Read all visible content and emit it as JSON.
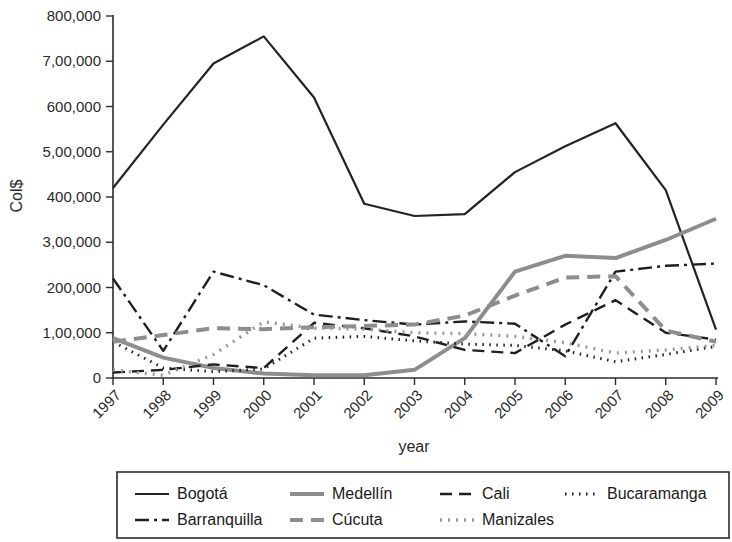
{
  "chart_data": {
    "type": "line",
    "title": "",
    "xlabel": "year",
    "ylabel": "Col$",
    "x": [
      1997,
      1998,
      1999,
      2000,
      2001,
      2002,
      2003,
      2004,
      2005,
      2006,
      2007,
      2008,
      2009
    ],
    "xtick_labels": [
      "1997",
      "1998",
      "1999",
      "2000",
      "2001",
      "2002",
      "2003",
      "2004",
      "2005",
      "2006",
      "2007",
      "2008",
      "2009"
    ],
    "ytick_values": [
      0,
      100000,
      200000,
      300000,
      400000,
      500000,
      600000,
      700000,
      800000
    ],
    "ytick_labels": [
      "0",
      "1,00,000",
      "200,000",
      "3,00,000",
      "400,000",
      "5,00,000",
      "600,000",
      "7,00,000",
      "800,000"
    ],
    "ylim": [
      0,
      800000
    ],
    "xlim": [
      1997,
      2009
    ],
    "grid": false,
    "legend_position": "bottom",
    "series": [
      {
        "name": "Bogotá",
        "style": "solid",
        "color": "#232323",
        "width": 2.2,
        "dash": "none",
        "values": [
          420000,
          560000,
          695000,
          755000,
          620000,
          385000,
          358000,
          362000,
          455000,
          512000,
          563000,
          415000,
          107000
        ]
      },
      {
        "name": "Medellín",
        "style": "solid",
        "color": "#8d8d8d",
        "width": 4.0,
        "dash": "none",
        "values": [
          88000,
          45000,
          22000,
          10000,
          6000,
          6000,
          18000,
          88000,
          235000,
          270000,
          265000,
          305000,
          352000
        ]
      },
      {
        "name": "Cali",
        "style": "dashed",
        "color": "#1f1f1f",
        "width": 2.4,
        "dash": "12,7",
        "values": [
          12000,
          18000,
          30000,
          22000,
          122000,
          110000,
          92000,
          62000,
          55000,
          118000,
          172000,
          100000,
          85000
        ]
      },
      {
        "name": "Bucaramanga",
        "style": "dotted",
        "color": "#1f1f1f",
        "width": 3.0,
        "dash": "1.5,5.5",
        "values": [
          80000,
          22000,
          14000,
          20000,
          88000,
          92000,
          82000,
          75000,
          72000,
          60000,
          36000,
          52000,
          70000
        ]
      },
      {
        "name": "Barranquilla",
        "style": "dashdot",
        "color": "#1f1f1f",
        "width": 2.4,
        "dash": "14,5,3,5",
        "values": [
          220000,
          60000,
          235000,
          205000,
          140000,
          128000,
          118000,
          125000,
          120000,
          48000,
          235000,
          248000,
          253000
        ]
      },
      {
        "name": "Cúcuta",
        "style": "dashed",
        "color": "#8d8d8d",
        "width": 4.0,
        "dash": "13,8",
        "values": [
          80000,
          95000,
          110000,
          108000,
          112000,
          115000,
          118000,
          138000,
          182000,
          222000,
          225000,
          105000,
          80000
        ]
      },
      {
        "name": "Manizales",
        "style": "dotted",
        "color": "#9a9a9a",
        "width": 3.4,
        "dash": "2,6",
        "values": [
          18000,
          6000,
          52000,
          124000,
          110000,
          108000,
          100000,
          98000,
          92000,
          78000,
          55000,
          62000,
          72000
        ]
      }
    ]
  },
  "legend": {
    "entries": [
      {
        "label": "Bogotá"
      },
      {
        "label": "Medellín"
      },
      {
        "label": "Cali"
      },
      {
        "label": "Bucaramanga"
      },
      {
        "label": "Barranquilla"
      },
      {
        "label": "Cúcuta"
      },
      {
        "label": "Manizales"
      }
    ]
  }
}
